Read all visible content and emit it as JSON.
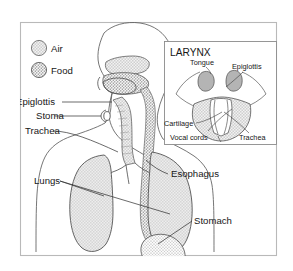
{
  "figure": {
    "frame_color": "#b9b9b9",
    "background_color": "#ffffff"
  },
  "legend": {
    "items": [
      {
        "label": "Air",
        "swatch": "air-swatch",
        "fill_style": "light-checker",
        "color": "#d8d8d8"
      },
      {
        "label": "Food",
        "swatch": "food-swatch",
        "fill_style": "dense-dots",
        "color": "#8f8f8f"
      }
    ]
  },
  "main_labels": [
    {
      "id": "epiglottis",
      "text": "Epiglottis",
      "side": "left"
    },
    {
      "id": "stoma",
      "text": "Stoma",
      "side": "left"
    },
    {
      "id": "trachea",
      "text": "Trachea",
      "side": "left"
    },
    {
      "id": "lungs",
      "text": "Lungs",
      "side": "left"
    },
    {
      "id": "esophagus",
      "text": "Esophagus",
      "side": "right"
    },
    {
      "id": "stomach",
      "text": "Stomach",
      "side": "right"
    }
  ],
  "inset": {
    "title": "LARYNX",
    "labels": [
      {
        "id": "tongue",
        "text": "Tongue"
      },
      {
        "id": "epiglottis",
        "text": "Epiglottis"
      },
      {
        "id": "cartilage",
        "text": "Cartilage"
      },
      {
        "id": "vocal-cords",
        "text": "Vocal cords"
      },
      {
        "id": "trachea",
        "text": "Trachea"
      }
    ]
  }
}
